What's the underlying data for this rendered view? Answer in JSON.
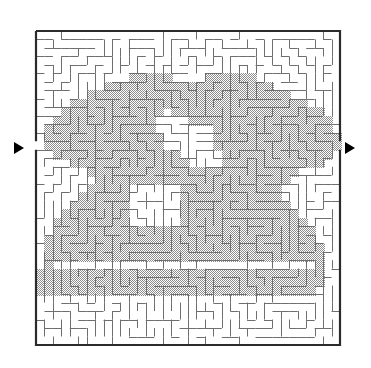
{
  "figure": {
    "kind": "maze-puzzle",
    "title": "",
    "caption": "",
    "background_color": "#ffffff"
  },
  "maze": {
    "bounds": {
      "x": 36,
      "y": 31,
      "width": 304,
      "height": 314
    },
    "grid": {
      "cols": 36,
      "rows": 37
    },
    "cell_size": 8.44,
    "wall_color": "#6e6e6e",
    "border_color": "#2b2b2b",
    "wall_width": 1,
    "border_width": 2.2,
    "passage_color": "#ffffff",
    "shaded_color": "#a9a9a9",
    "shade_style": "halftone",
    "random_seed": 20240517
  },
  "entrance": {
    "label": "entrance-arrow",
    "side": "left",
    "glyph": "right-triangle",
    "color": "#000000",
    "x": 14,
    "y": 142,
    "size": 13,
    "row": 13
  },
  "exit": {
    "label": "exit-arrow",
    "side": "right",
    "glyph": "right-triangle",
    "color": "#000000",
    "x": 345,
    "y": 142,
    "size": 13,
    "row": 13
  },
  "shaded_shape": {
    "name": "butterfly-silhouette",
    "description": "Large shaded region occupying the middle of the maze, shaped like a stylised butterfly or mask with two white eye-holes and a white mouth slot near the bottom.",
    "fill": "#a9a9a9",
    "outline_rows": [
      {
        "row": 5,
        "spans": [
          [
            11,
            15
          ],
          [
            20,
            25
          ]
        ]
      },
      {
        "row": 6,
        "spans": [
          [
            8,
            27
          ]
        ]
      },
      {
        "row": 7,
        "spans": [
          [
            6,
            29
          ]
        ]
      },
      {
        "row": 8,
        "spans": [
          [
            4,
            31
          ]
        ]
      },
      {
        "row": 9,
        "spans": [
          [
            3,
            14
          ],
          [
            16,
            33
          ]
        ]
      },
      {
        "row": 10,
        "spans": [
          [
            2,
            13
          ],
          [
            18,
            34
          ]
        ]
      },
      {
        "row": 11,
        "spans": [
          [
            1,
            13
          ],
          [
            19,
            34
          ]
        ]
      },
      {
        "row": 12,
        "spans": [
          [
            1,
            14
          ],
          [
            20,
            35
          ]
        ]
      },
      {
        "row": 13,
        "spans": [
          [
            1,
            15
          ],
          [
            21,
            35
          ]
        ]
      },
      {
        "row": 14,
        "spans": [
          [
            2,
            16
          ],
          [
            22,
            34
          ]
        ]
      },
      {
        "row": 15,
        "spans": [
          [
            4,
            17
          ],
          [
            22,
            33
          ]
        ]
      },
      {
        "row": 16,
        "spans": [
          [
            6,
            30
          ]
        ]
      },
      {
        "row": 17,
        "spans": [
          [
            7,
            29
          ]
        ]
      },
      {
        "row": 18,
        "spans": [
          [
            6,
            12
          ],
          [
            14,
            28
          ]
        ]
      },
      {
        "row": 19,
        "spans": [
          [
            5,
            11
          ],
          [
            16,
            28
          ]
        ]
      },
      {
        "row": 20,
        "spans": [
          [
            4,
            10
          ],
          [
            17,
            29
          ]
        ]
      },
      {
        "row": 21,
        "spans": [
          [
            3,
            10
          ],
          [
            17,
            30
          ]
        ]
      },
      {
        "row": 22,
        "spans": [
          [
            2,
            11
          ],
          [
            16,
            31
          ]
        ]
      },
      {
        "row": 23,
        "spans": [
          [
            2,
            32
          ]
        ]
      },
      {
        "row": 24,
        "spans": [
          [
            1,
            32
          ]
        ]
      },
      {
        "row": 25,
        "spans": [
          [
            1,
            33
          ]
        ]
      },
      {
        "row": 26,
        "spans": [
          [
            1,
            33
          ]
        ]
      },
      {
        "row": 27,
        "spans": [
          [
            1,
            2
          ],
          [
            32,
            33
          ]
        ]
      },
      {
        "row": 28,
        "spans": [
          [
            0,
            33
          ]
        ]
      },
      {
        "row": 29,
        "spans": [
          [
            0,
            33
          ]
        ]
      },
      {
        "row": 30,
        "spans": [
          [
            0,
            32
          ]
        ]
      }
    ],
    "white_holes": [
      {
        "name": "left-eye",
        "row_start": 11,
        "row_end": 13,
        "col_start": 15,
        "col_end": 20
      },
      {
        "name": "right-eye",
        "row_start": 18,
        "row_end": 22,
        "col_start": 11,
        "col_end": 16
      },
      {
        "name": "mouth-slot",
        "row_start": 27,
        "row_end": 27,
        "col_start": 2,
        "col_end": 32
      }
    ]
  },
  "legend": {
    "items": []
  }
}
